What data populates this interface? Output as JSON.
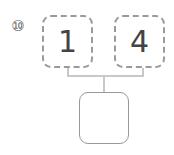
{
  "problem": {
    "number_label": "⑩",
    "inputs": [
      {
        "value": "1"
      },
      {
        "value": "4"
      }
    ],
    "answer": {
      "value": ""
    }
  },
  "colors": {
    "box_border": "#9a9a9a",
    "connector": "#c8c8c8",
    "text": "#444444"
  }
}
